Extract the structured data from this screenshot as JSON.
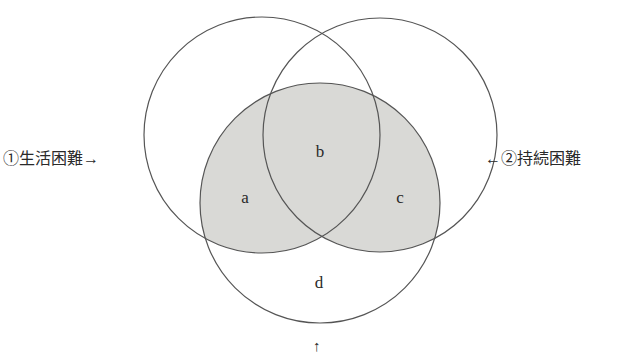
{
  "diagram": {
    "type": "venn",
    "circles": [
      {
        "id": "circle-1",
        "label": "①生活困難→",
        "cx": 262,
        "cy": 135,
        "r": 118
      },
      {
        "id": "circle-2",
        "label": "←②持続困難",
        "cx": 380,
        "cy": 135,
        "r": 117
      },
      {
        "id": "circle-3",
        "label": "↑",
        "cx": 320,
        "cy": 203,
        "r": 120,
        "shaded": true
      }
    ],
    "regions": [
      {
        "label": "a",
        "x": 245,
        "y": 198
      },
      {
        "label": "b",
        "x": 320,
        "y": 152
      },
      {
        "label": "c",
        "x": 400,
        "y": 198
      },
      {
        "label": "d",
        "x": 319,
        "y": 283
      }
    ],
    "colors": {
      "stroke": "#555555",
      "shade": "#d9d9d6",
      "background": "#ffffff"
    }
  },
  "labels": {
    "left": "①生活困難→",
    "right": "←②持続困難",
    "bottom": "↑"
  }
}
